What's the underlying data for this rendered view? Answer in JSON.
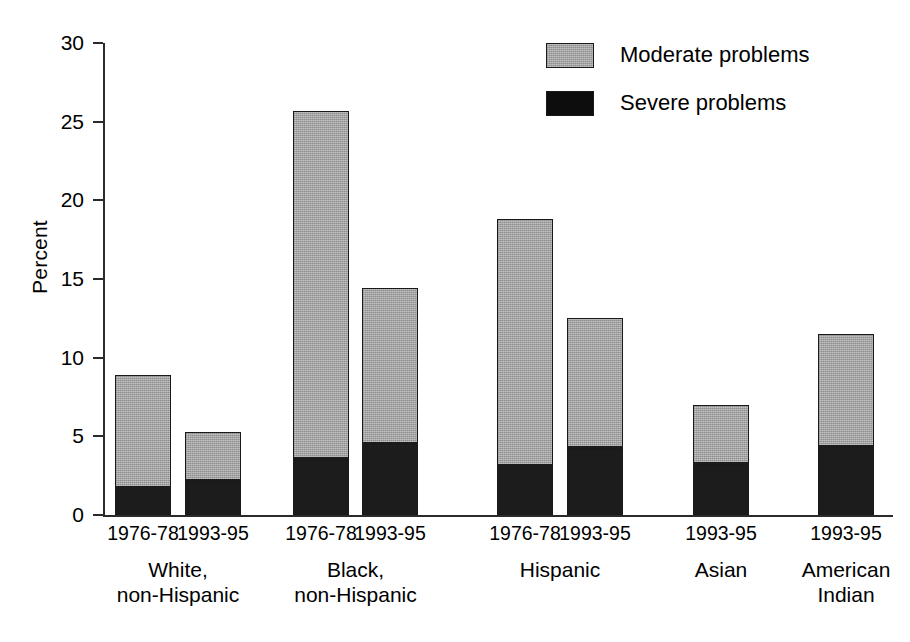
{
  "chart_data": {
    "type": "bar",
    "subtype": "stacked-bar",
    "title": "",
    "xlabel": "",
    "ylabel": "Percent",
    "ylim": [
      0,
      30
    ],
    "yticks": [
      0,
      5,
      10,
      15,
      20,
      25,
      30
    ],
    "ytick_labels": [
      "0",
      "5",
      "10",
      "15",
      "20",
      "25",
      "30"
    ],
    "grid": false,
    "legend_position": "top-right",
    "legend": [
      "Moderate problems",
      "Severe problems"
    ],
    "categories": [
      "White, non-Hispanic 1976-78",
      "White, non-Hispanic 1993-95",
      "Black, non-Hispanic 1976-78",
      "Black, non-Hispanic 1993-95",
      "Hispanic 1976-78",
      "Hispanic 1993-95",
      "Asian 1993-95",
      "American Indian 1993-95"
    ],
    "series": [
      {
        "name": "Severe problems",
        "color": "#1c1c1c",
        "values": [
          1.8,
          2.2,
          3.6,
          4.6,
          3.2,
          4.3,
          3.3,
          4.4
        ]
      },
      {
        "name": "Moderate problems",
        "color": "#a3a3a3",
        "values": [
          7.1,
          3.1,
          22.1,
          9.8,
          15.6,
          8.2,
          3.7,
          7.1
        ]
      }
    ],
    "totals": [
      8.9,
      5.3,
      25.7,
      14.4,
      18.8,
      12.5,
      7.0,
      11.5
    ]
  },
  "axis": {
    "y_label": "Percent",
    "y_ticks": [
      {
        "value": 30,
        "label": "30"
      },
      {
        "value": 25,
        "label": "25"
      },
      {
        "value": 20,
        "label": "20"
      },
      {
        "value": 15,
        "label": "15"
      },
      {
        "value": 10,
        "label": "10"
      },
      {
        "value": 5,
        "label": "5"
      },
      {
        "value": 0,
        "label": "0"
      }
    ]
  },
  "legend": {
    "items": [
      {
        "label": "Moderate problems",
        "swatch": "moderate-swatch"
      },
      {
        "label": "Severe problems",
        "swatch": "severe-swatch"
      }
    ]
  },
  "groups": [
    {
      "name": "White, non-Hispanic",
      "label_line1": "White,",
      "label_line2": "non-Hispanic",
      "bars": [
        {
          "period": "1976-78",
          "severe": 1.8,
          "moderate": 7.1,
          "total": 8.9
        },
        {
          "period": "1993-95",
          "severe": 2.2,
          "moderate": 3.1,
          "total": 5.3
        }
      ]
    },
    {
      "name": "Black, non-Hispanic",
      "label_line1": "Black,",
      "label_line2": "non-Hispanic",
      "bars": [
        {
          "period": "1976-78",
          "severe": 3.6,
          "moderate": 22.1,
          "total": 25.7
        },
        {
          "period": "1993-95",
          "severe": 4.6,
          "moderate": 9.8,
          "total": 14.4
        }
      ]
    },
    {
      "name": "Hispanic",
      "label_line1": "Hispanic",
      "label_line2": "",
      "bars": [
        {
          "period": "1976-78",
          "severe": 3.2,
          "moderate": 15.6,
          "total": 18.8
        },
        {
          "period": "1993-95",
          "severe": 4.3,
          "moderate": 8.2,
          "total": 12.5
        }
      ]
    },
    {
      "name": "Asian",
      "label_line1": "Asian",
      "label_line2": "",
      "bars": [
        {
          "period": "1993-95",
          "severe": 3.3,
          "moderate": 3.7,
          "total": 7.0
        }
      ]
    },
    {
      "name": "American Indian",
      "label_line1": "American",
      "label_line2": "Indian",
      "bars": [
        {
          "period": "1993-95",
          "severe": 4.4,
          "moderate": 7.1,
          "total": 11.5
        }
      ]
    }
  ],
  "colors": {
    "moderate": "#a3a3a3",
    "severe": "#1c1c1c",
    "axis": "#2b2b2b",
    "background": "#ffffff"
  }
}
